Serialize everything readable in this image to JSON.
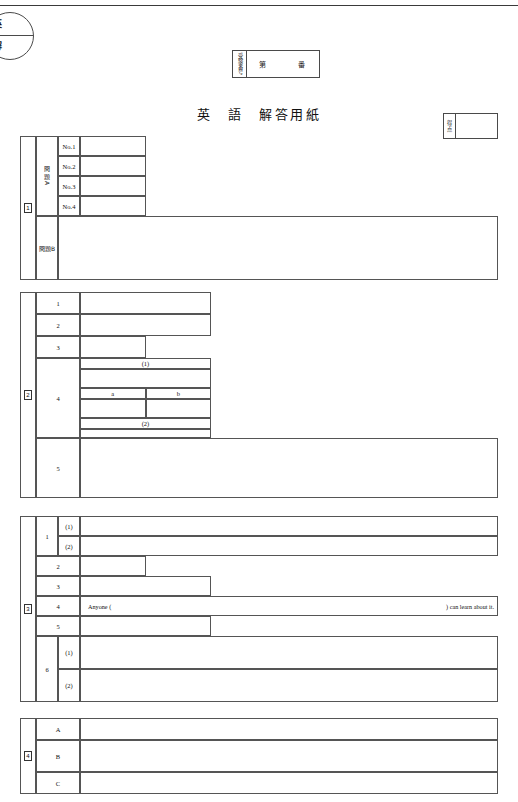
{
  "document": {
    "title": "英　語　解答用紙",
    "corner_stamp": {
      "top_char": "英",
      "bottom_char": "解"
    }
  },
  "exam_number": {
    "label": "受験番号",
    "prefix": "第",
    "suffix": "番",
    "value": ""
  },
  "score": {
    "label_chars": [
      "得",
      "点"
    ],
    "value": ""
  },
  "questions": [
    {
      "marker": "1",
      "groups": [
        {
          "label": "問題A",
          "rows": [
            {
              "label": "No.1",
              "answer": ""
            },
            {
              "label": "No.2",
              "answer": ""
            },
            {
              "label": "No.3",
              "answer": ""
            },
            {
              "label": "No.4",
              "answer": ""
            }
          ]
        },
        {
          "label": "問題B",
          "rows": [
            {
              "label": "",
              "answer": ""
            }
          ]
        }
      ]
    },
    {
      "marker": "2",
      "rows": [
        {
          "label": "1",
          "answer": ""
        },
        {
          "label": "2",
          "answer": ""
        },
        {
          "label": "3",
          "answer": ""
        },
        {
          "label": "4",
          "subheaders": [
            "(1)",
            "a",
            "b",
            "(2)"
          ],
          "answer": ""
        },
        {
          "label": "5",
          "answer": ""
        }
      ]
    },
    {
      "marker": "3",
      "rows": [
        {
          "label": "1",
          "sublabels": [
            "(1)",
            "(2)"
          ],
          "answer": ""
        },
        {
          "label": "2",
          "answer": ""
        },
        {
          "label": "3",
          "answer": ""
        },
        {
          "label": "4",
          "answer": "",
          "prompt_left": "Anyone (",
          "prompt_right": ") can learn about it."
        },
        {
          "label": "5",
          "answer": ""
        },
        {
          "label": "6",
          "sublabels": [
            "(1)",
            "(2)"
          ],
          "answer": ""
        }
      ]
    },
    {
      "marker": "4",
      "rows": [
        {
          "label": "A",
          "answer": ""
        },
        {
          "label": "B",
          "answer": ""
        },
        {
          "label": "C",
          "answer": ""
        }
      ]
    }
  ]
}
